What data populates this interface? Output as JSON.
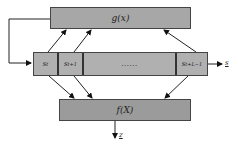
{
  "diagram": {
    "top_block": {
      "label": "g(x)"
    },
    "sequence_block": {
      "cells": [
        {
          "label": "s_t",
          "display": "s",
          "sub": "t"
        },
        {
          "label": "s_{t+1}",
          "display": "s",
          "sub": "t+1"
        },
        {
          "label": "......",
          "display": "......",
          "sub": ""
        },
        {
          "label": "s_{t+L-1}",
          "display": "s",
          "sub": "t+L−1"
        }
      ]
    },
    "bottom_block": {
      "label": "f(X)"
    },
    "outputs": {
      "sequence_output": "s",
      "bottom_output": "z"
    },
    "colors": {
      "top_block_fill": "#a7a7a7",
      "sequence_fill": "#b0b0b0",
      "bottom_block_fill": "#9b9b9b",
      "stroke": "#333333"
    }
  }
}
